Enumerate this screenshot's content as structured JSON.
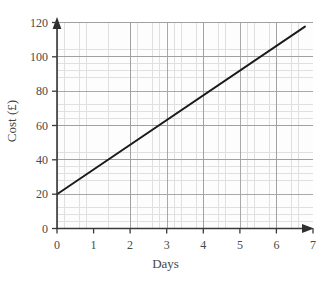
{
  "chart_data": {
    "type": "line",
    "title": "",
    "xlabel": "Days",
    "ylabel": "Cost (£)",
    "xlim": [
      0,
      7
    ],
    "ylim": [
      0,
      120
    ],
    "xticks": [
      "0",
      "1",
      "2",
      "3",
      "4",
      "5",
      "6",
      "7"
    ],
    "yticks": [
      "0",
      "20",
      "40",
      "60",
      "80",
      "100",
      "120"
    ],
    "xtick_values": [
      0,
      1,
      2,
      3,
      4,
      5,
      6,
      7
    ],
    "ytick_values": [
      0,
      20,
      40,
      60,
      80,
      100,
      120
    ],
    "grid": "graph-paper, minor squares with major line every 5 squares",
    "legend": "none",
    "series": [
      {
        "name": "Cost",
        "x": [
          0,
          1,
          2,
          3,
          4,
          5,
          6,
          6.78
        ],
        "values": [
          20,
          34.4,
          48.8,
          63.2,
          77.6,
          92,
          106.4,
          117.6
        ],
        "intercept": 20,
        "slope": 14.4,
        "color": "#1b1b1b",
        "style": "straight-line"
      }
    ],
    "annotations": []
  },
  "axes": {
    "x_arrow": "arrowhead-right",
    "y_arrow": "arrowhead-up",
    "axis_color": "#3a3a3a"
  },
  "colors": {
    "grid_minor": "#c9c9c9",
    "grid_major": "#8d8d8d",
    "line": "#1b1b1b",
    "text": "#4a4a4a",
    "background": "#ffffff"
  }
}
